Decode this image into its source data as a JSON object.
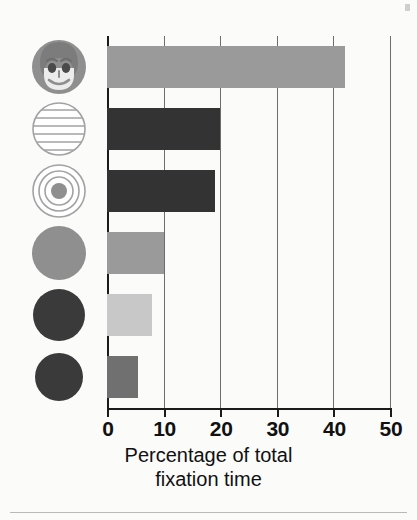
{
  "chart_data": {
    "type": "bar",
    "orientation": "horizontal",
    "title": "",
    "xlabel_lines": [
      "Percentage of total",
      "fixation time"
    ],
    "ylabel": "",
    "xlim": [
      0,
      50
    ],
    "xticks": [
      0,
      10,
      20,
      30,
      40,
      50
    ],
    "xtick_labels": [
      "0",
      "10",
      "20",
      "30",
      "40",
      "50"
    ],
    "grid": "vertical",
    "legend": "none",
    "categories": [
      "face",
      "horizontal-stripes-circle",
      "concentric-circles",
      "solid-medium-gray-circle",
      "solid-dark-circle-large",
      "solid-dark-circle-small"
    ],
    "values": [
      42,
      20,
      19,
      10,
      8,
      5.5
    ],
    "bar_colors": [
      "#9a9a9a",
      "#333333",
      "#333333",
      "#9a9a9a",
      "#c8c8c8",
      "#707070"
    ]
  },
  "icons": [
    {
      "name": "face-icon",
      "label": "face"
    },
    {
      "name": "striped-circle-icon",
      "label": "horizontal stripes circle"
    },
    {
      "name": "concentric-circles-icon",
      "label": "concentric circles"
    },
    {
      "name": "gray-disc-icon",
      "label": "solid medium gray circle"
    },
    {
      "name": "dark-disc-large-icon",
      "label": "solid dark circle"
    },
    {
      "name": "dark-disc-small-icon",
      "label": "solid dark circle"
    }
  ],
  "axis": {
    "title_line1": "Percentage of total",
    "title_line2": "fixation time"
  },
  "colors": {
    "axis": "#1b1b1b",
    "grid": "#6d6d6d",
    "background": "#fbfbfa",
    "icon_gray": "#8f8f8f",
    "icon_dark": "#3a3a3a",
    "icon_outline": "#a2a2a2"
  }
}
